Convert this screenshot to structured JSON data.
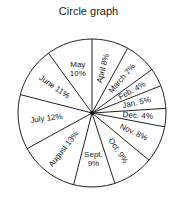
{
  "chart_data": {
    "type": "pie",
    "title": "Circle graph",
    "start_angle_deg": 0,
    "direction": "clockwise",
    "slices": [
      {
        "label": "April",
        "value": 8,
        "text": "April 8%"
      },
      {
        "label": "March",
        "value": 7,
        "text": "March 7%"
      },
      {
        "label": "Feb.",
        "value": 4,
        "text": "Feb. 4%"
      },
      {
        "label": "Jan.",
        "value": 5,
        "text": "Jan. 5%"
      },
      {
        "label": "Dec.",
        "value": 4,
        "text": "Dec. 4%"
      },
      {
        "label": "Nov.",
        "value": 8,
        "text": "Nov. 8%"
      },
      {
        "label": "Oct.",
        "value": 9,
        "text": "Oct. 9%"
      },
      {
        "label": "Sept.",
        "value": 9,
        "text": "Sept. 9%"
      },
      {
        "label": "August",
        "value": 13,
        "text": "August 13%"
      },
      {
        "label": "July",
        "value": 12,
        "text": "July 12%"
      },
      {
        "label": "June",
        "value": 11,
        "text": "June 11%"
      },
      {
        "label": "May",
        "value": 10,
        "text": "May 10%"
      }
    ],
    "units": "%"
  }
}
